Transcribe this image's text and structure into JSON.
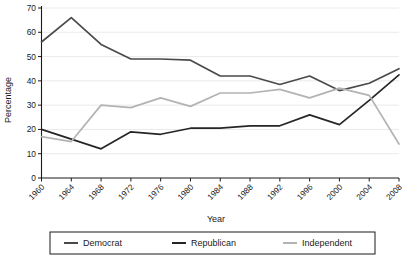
{
  "chart_data": {
    "type": "line",
    "title": "",
    "xlabel": "Year",
    "ylabel": "Percentage",
    "x": [
      1960,
      1964,
      1968,
      1972,
      1976,
      1980,
      1984,
      1988,
      1992,
      1996,
      2000,
      2004,
      2008
    ],
    "categories": [
      "1960",
      "1964",
      "1968",
      "1972",
      "1976",
      "1980",
      "1984",
      "1988",
      "1992",
      "1996",
      "2000",
      "2004",
      "2008"
    ],
    "xlim": [
      1960,
      2008
    ],
    "ylim": [
      0,
      70
    ],
    "ytick_labels": [
      "0",
      "10",
      "20",
      "30",
      "40",
      "50",
      "60",
      "70"
    ],
    "ytick_values": [
      0,
      10,
      20,
      30,
      40,
      50,
      60,
      70
    ],
    "grid": true,
    "grid_axis": "y",
    "legend_position": "bottom",
    "series": [
      {
        "name": "Democrat",
        "color": "#4a4a4a",
        "values": [
          56,
          66,
          55,
          49,
          49,
          48.5,
          42,
          42,
          38.5,
          42,
          36,
          39,
          45
        ]
      },
      {
        "name": "Republican",
        "color": "#262626",
        "values": [
          20,
          16,
          12,
          19,
          18,
          20.5,
          20.5,
          21.5,
          21.5,
          26,
          22,
          32,
          42.5
        ]
      },
      {
        "name": "Independent",
        "color": "#b3b3b3",
        "values": [
          17,
          15,
          30,
          29,
          33,
          29.5,
          35,
          35,
          36.5,
          33,
          37,
          34,
          14
        ]
      }
    ]
  },
  "legend": {
    "entries": [
      {
        "label": "Democrat"
      },
      {
        "label": "Republican"
      },
      {
        "label": "Independent"
      }
    ]
  }
}
